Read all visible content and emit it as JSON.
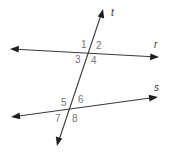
{
  "diagram": {
    "lines": {
      "r": {
        "label": "r"
      },
      "s": {
        "label": "s"
      },
      "t": {
        "label": "t"
      }
    },
    "angles": [
      "1",
      "2",
      "3",
      "4",
      "5",
      "6",
      "7",
      "8"
    ],
    "colors": {
      "line": "#3a3a3a",
      "angle_label": "#777777",
      "line_label": "#333333"
    }
  }
}
